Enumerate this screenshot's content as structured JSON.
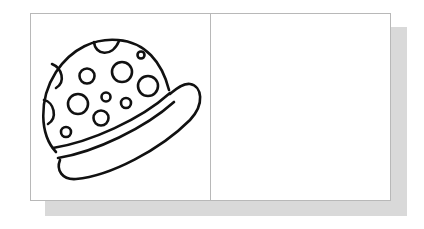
{
  "figure": {
    "layout": "two-panel frame with drop shadow",
    "panels": [
      {
        "position": "left",
        "content": "hat-drawing",
        "icon": "spotted-hat-icon"
      },
      {
        "position": "right",
        "content": "empty"
      }
    ],
    "colors": {
      "frame_border": "#b8b8b8",
      "shadow": "#d9d9d9",
      "stroke": "#111111",
      "background": "#ffffff"
    }
  }
}
